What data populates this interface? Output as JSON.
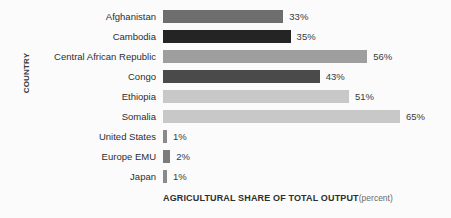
{
  "chart_data": {
    "type": "bar",
    "orientation": "horizontal",
    "title": "",
    "xlabel": "AGRICULTURAL SHARE OF TOTAL OUTPUT",
    "xlabel_unit": "(percent)",
    "ylabel": "COUNTRY",
    "grid": false,
    "legend": "none",
    "xlim": [
      0,
      65
    ],
    "categories": [
      "Afghanistan",
      "Cambodia",
      "Central African Republic",
      "Congo",
      "Ethiopia",
      "Somalia",
      "United States",
      "Europe EMU",
      "Japan"
    ],
    "values": [
      33,
      35,
      56,
      43,
      51,
      65,
      1,
      2,
      1
    ],
    "value_labels": [
      "33%",
      "35%",
      "56%",
      "43%",
      "51%",
      "65%",
      "1%",
      "2%",
      "1%"
    ],
    "bar_colors": [
      "#6e6e6e",
      "#242424",
      "#9e9e9e",
      "#4a4a4a",
      "#c8c8c8",
      "#c8c8c8",
      "#8a8a8a",
      "#7c7c7c",
      "#8a8a8a"
    ]
  },
  "colors": {
    "background": "#fbfbfb",
    "label_text": "#2e2e2e",
    "value_text": "#3a3a3a",
    "axis_title": "#3a3a3a"
  }
}
